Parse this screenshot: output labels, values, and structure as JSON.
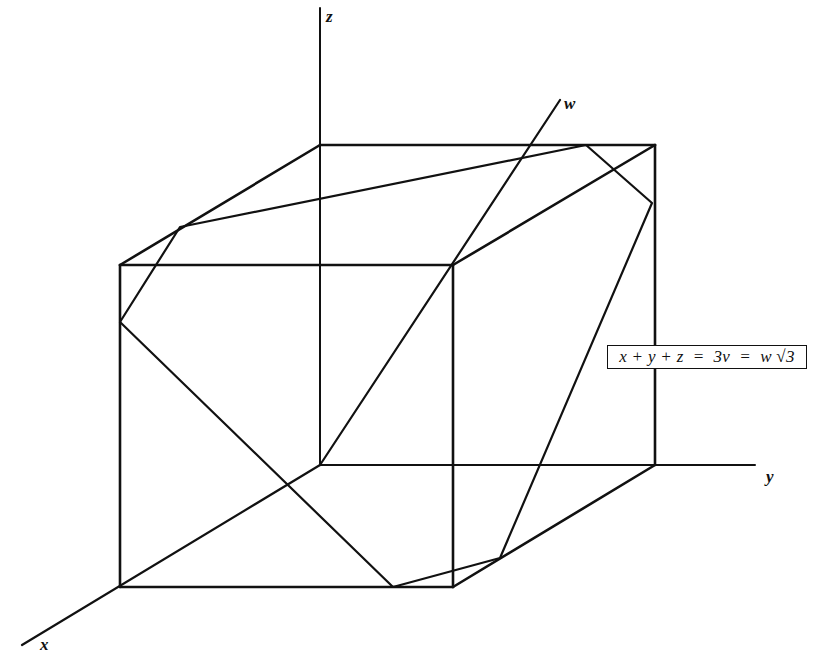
{
  "diagram": {
    "stroke_color": "#111111",
    "background_color": "#ffffff",
    "axes": {
      "x": {
        "label": "x",
        "from": [
          320,
          465
        ],
        "to": [
          22,
          645
        ],
        "label_pos": [
          40,
          640
        ]
      },
      "y": {
        "label": "y",
        "from": [
          320,
          465
        ],
        "to": [
          755,
          465
        ],
        "label_pos": [
          766,
          470
        ]
      },
      "z": {
        "label": "z",
        "from": [
          320,
          465
        ],
        "to": [
          320,
          8
        ],
        "label_pos": [
          328,
          8
        ]
      },
      "w": {
        "label": "w",
        "from": [
          320,
          465
        ],
        "to": [
          560,
          100
        ],
        "label_pos": [
          565,
          96
        ]
      }
    },
    "cube": {
      "vertices": {
        "back_top_left": [
          320,
          145
        ],
        "back_top_right": [
          655,
          145
        ],
        "back_bottom_left": [
          320,
          465
        ],
        "back_bottom_right": [
          655,
          465
        ],
        "front_top_left": [
          120,
          265
        ],
        "front_top_right": [
          453,
          265
        ],
        "front_bottom_left": [
          120,
          587
        ],
        "front_bottom_right": [
          453,
          587
        ]
      }
    },
    "hexagon": {
      "points": [
        [
          180,
          227
        ],
        [
          586,
          145
        ],
        [
          652,
          203
        ],
        [
          500,
          558
        ],
        [
          393,
          587
        ],
        [
          120,
          322
        ]
      ]
    },
    "equation": {
      "text": "x + y + z  =  3v  =  w √3"
    }
  }
}
